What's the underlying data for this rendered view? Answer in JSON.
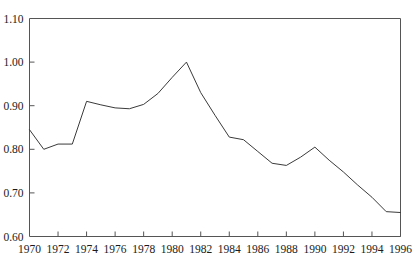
{
  "chart_data": {
    "type": "line",
    "title": "",
    "subtitle": "",
    "xlabel": "",
    "ylabel": "",
    "xlim": [
      1970,
      1996
    ],
    "ylim": [
      0.6,
      1.1
    ],
    "grid": false,
    "legend": null,
    "y_ticks": [
      0.6,
      0.7,
      0.8,
      0.9,
      1.0,
      1.1
    ],
    "y_tick_labels": [
      "0.60",
      "0.70",
      "0.80",
      "0.90",
      "1.00",
      "1.10"
    ],
    "x_ticks": [
      1970,
      1972,
      1974,
      1976,
      1978,
      1980,
      1982,
      1984,
      1986,
      1988,
      1990,
      1992,
      1994,
      1996
    ],
    "x_tick_labels": [
      "1970",
      "1972",
      "1974",
      "1976",
      "1978",
      "1980",
      "1982",
      "1984",
      "1986",
      "1988",
      "1990",
      "1992",
      "1994",
      "1996"
    ],
    "line_color": "#3a3a3a",
    "line_width": 1,
    "frame_color": "#555555",
    "background": "#ffffff",
    "x": [
      1970,
      1971,
      1972,
      1973,
      1974,
      1975,
      1976,
      1977,
      1978,
      1979,
      1980,
      1981,
      1982,
      1983,
      1984,
      1985,
      1986,
      1987,
      1988,
      1989,
      1990,
      1991,
      1992,
      1993,
      1994,
      1995,
      1996
    ],
    "values": [
      0.845,
      0.8,
      0.812,
      0.812,
      0.91,
      0.902,
      0.895,
      0.893,
      0.903,
      0.928,
      0.965,
      1.0,
      0.93,
      0.878,
      0.828,
      0.822,
      0.795,
      0.768,
      0.763,
      0.782,
      0.805,
      0.775,
      0.748,
      0.718,
      0.69,
      0.657,
      0.655
    ],
    "series": [
      {
        "name": "series-1",
        "values": [
          0.845,
          0.8,
          0.812,
          0.812,
          0.91,
          0.902,
          0.895,
          0.893,
          0.903,
          0.928,
          0.965,
          1.0,
          0.93,
          0.878,
          0.828,
          0.822,
          0.795,
          0.768,
          0.763,
          0.782,
          0.805,
          0.775,
          0.748,
          0.718,
          0.69,
          0.657,
          0.655
        ]
      }
    ]
  }
}
